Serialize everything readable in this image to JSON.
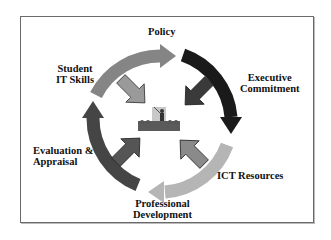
{
  "diagram": {
    "cycle_nodes": [
      {
        "id": "policy",
        "label": "Policy",
        "color": "#8a8a8a"
      },
      {
        "id": "executive",
        "label_line1": "Executive",
        "label_line2": "Commitment",
        "color": "#1a1a1a"
      },
      {
        "id": "ict",
        "label": "ICT Resources",
        "color": "#b3b3b3"
      },
      {
        "id": "prof",
        "label_line1": "Professional",
        "label_line2": "Development",
        "color": "#b3b3b3"
      },
      {
        "id": "eval",
        "label_line1": "Evaluation &",
        "label_line2": "Appraisal",
        "color": "#4a4a4a"
      },
      {
        "id": "student",
        "label_line1": "Student",
        "label_line2": "IT Skills",
        "color": "#777777"
      }
    ],
    "center": {
      "icon": "teacher-classroom-icon"
    },
    "inward_arrows": [
      {
        "from": "top-left",
        "color": "#9a9a9a"
      },
      {
        "from": "top-right",
        "color": "#3a3a3a"
      },
      {
        "from": "bottom-left",
        "color": "#555555"
      },
      {
        "from": "bottom-right",
        "color": "#8a8a8a"
      }
    ],
    "frame_color": "#6a6a6a"
  }
}
